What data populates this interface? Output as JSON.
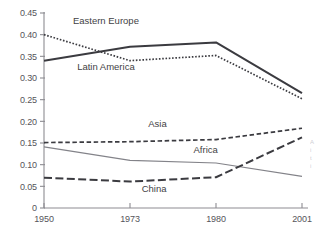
{
  "chart_data": {
    "type": "line",
    "title": "",
    "subtitle": "",
    "xlabel": "",
    "ylabel": "",
    "categories": [
      "1950",
      "1973",
      "1980",
      "2001"
    ],
    "x_tick_labels": [
      "1950",
      "1973",
      "1980",
      "2001"
    ],
    "y_tick_labels": [
      "0",
      "0.05",
      "0.10",
      "0.15",
      "0.20",
      "0.25",
      "0.30",
      "0.35",
      "0.40",
      "0.45"
    ],
    "y_tick_values": [
      0,
      0.05,
      0.1,
      0.15,
      0.2,
      0.25,
      0.3,
      0.35,
      0.4,
      0.45
    ],
    "ylim": [
      0,
      0.45
    ],
    "xlim_categorical": true,
    "grid": false,
    "legend": "inline-annotations",
    "legend_position": "on-plot",
    "series": [
      {
        "name": "Eastern Europe",
        "style": "solid-thick",
        "color": "#3b3b40",
        "values": [
          0.34,
          0.372,
          0.382,
          0.265
        ],
        "label_x_category_frac": 0.72,
        "label_value": 0.425
      },
      {
        "name": "Latin America",
        "style": "dotted",
        "color": "#3b3b40",
        "values": [
          0.4,
          0.34,
          0.352,
          0.252
        ],
        "label_x_category_frac": 0.72,
        "label_value": 0.318
      },
      {
        "name": "Asia",
        "style": "dashed",
        "color": "#3b3b40",
        "values": [
          0.151,
          0.153,
          0.158,
          0.184
        ],
        "label_x_category_frac": 1.32,
        "label_value": 0.186
      },
      {
        "name": "Africa",
        "style": "solid-thin",
        "color": "#838389",
        "values": [
          0.141,
          0.11,
          0.104,
          0.073
        ],
        "label_x_category_frac": 1.88,
        "label_value": 0.128
      },
      {
        "name": "China",
        "style": "long-dash",
        "color": "#3b3b40",
        "values": [
          0.07,
          0.061,
          0.071,
          0.163
        ],
        "label_x_category_frac": 1.28,
        "label_value": 0.036
      }
    ],
    "annotations": []
  },
  "margin_gutter": {
    "line1": "A",
    "line2": "i",
    "line3": "t",
    "line4": "i"
  }
}
